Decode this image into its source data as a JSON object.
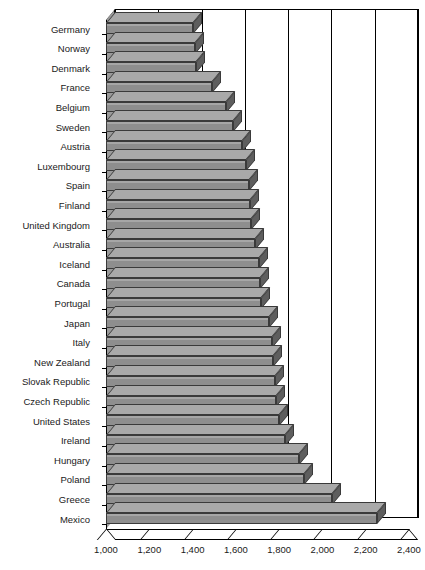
{
  "chart_data": {
    "type": "bar",
    "orientation": "horizontal",
    "title": "",
    "subtitle": "",
    "xlabel": "",
    "ylabel": "",
    "xlim": [
      1000,
      2400
    ],
    "xticks": [
      1000,
      1200,
      1400,
      1600,
      1800,
      2000,
      2200,
      2400
    ],
    "xtick_labels": [
      "1,000",
      "1,200",
      "1,400",
      "1,600",
      "1,800",
      "2,000",
      "2,200",
      "2,400"
    ],
    "grid": true,
    "legend": "none",
    "style": "3d-horizontal-bar",
    "bar_color": "#8e8e8e",
    "bar_edge_color": "#3a3a3a",
    "axis_color": "#000000",
    "categories": [
      "Germany",
      "Norway",
      "Denmark",
      "France",
      "Belgium",
      "Sweden",
      "Austria",
      "Luxembourg",
      "Spain",
      "Finland",
      "United Kingdom",
      "Australia",
      "Iceland",
      "Canada",
      "Portugal",
      "Japan",
      "Italy",
      "New Zealand",
      "Slovak Republic",
      "Czech Republic",
      "United States",
      "Ireland",
      "Hungary",
      "Poland",
      "Greece",
      "Mexico"
    ],
    "values": [
      1400,
      1410,
      1415,
      1490,
      1555,
      1585,
      1630,
      1645,
      1660,
      1665,
      1670,
      1690,
      1705,
      1710,
      1715,
      1755,
      1765,
      1770,
      1780,
      1785,
      1800,
      1825,
      1890,
      1915,
      2045,
      2250
    ]
  }
}
